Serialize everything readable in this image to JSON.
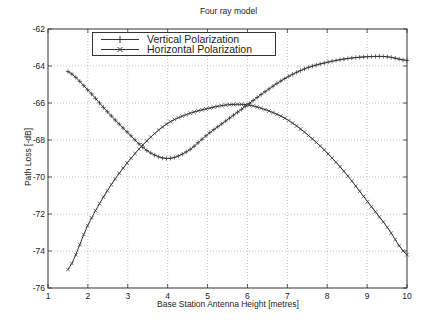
{
  "chart_data": {
    "type": "line",
    "title": "Four ray model",
    "xlabel": "Base Station Antenna Height [metres]",
    "ylabel": "Path Loss [-dB]",
    "xlim": [
      1,
      10
    ],
    "ylim": [
      -76,
      -62
    ],
    "xticks": [
      1,
      2,
      3,
      4,
      5,
      6,
      7,
      8,
      9,
      10
    ],
    "yticks": [
      -62,
      -64,
      -66,
      -68,
      -70,
      -72,
      -74,
      -76
    ],
    "grid": true,
    "legend_position": "upper left",
    "x": [
      1.5,
      2,
      2.5,
      3,
      3.5,
      4,
      4.5,
      5,
      5.5,
      6,
      6.5,
      7,
      7.5,
      8,
      8.5,
      9,
      9.5,
      10
    ],
    "series": [
      {
        "name": "Vertical Polarization",
        "marker": "+",
        "values": [
          -64.3,
          -65.3,
          -66.5,
          -67.6,
          -68.6,
          -69.0,
          -68.6,
          -67.7,
          -66.9,
          -66.1,
          -65.3,
          -64.6,
          -64.1,
          -63.8,
          -63.6,
          -63.5,
          -63.5,
          -63.7
        ]
      },
      {
        "name": "Horizontal Polarization",
        "marker": "x",
        "values": [
          -75.0,
          -72.6,
          -70.7,
          -69.2,
          -68.0,
          -67.1,
          -66.6,
          -66.3,
          -66.1,
          -66.1,
          -66.4,
          -66.9,
          -67.7,
          -68.7,
          -69.9,
          -71.3,
          -72.7,
          -74.2
        ]
      }
    ]
  },
  "legend": {
    "items": [
      {
        "label": "Vertical Polarization"
      },
      {
        "label": "Horizontal Polarization"
      }
    ]
  }
}
